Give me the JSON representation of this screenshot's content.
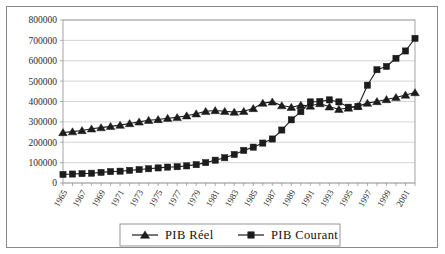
{
  "chart_data": {
    "type": "line",
    "title": "",
    "xlabel": "",
    "ylabel": "",
    "ylim": [
      0,
      800000
    ],
    "ytick_step": 100000,
    "yticks": [
      "0",
      "100000",
      "200000",
      "300000",
      "400000",
      "500000",
      "600000",
      "700000",
      "800000"
    ],
    "grid": true,
    "legend_position": "bottom",
    "x": [
      1965,
      1966,
      1967,
      1968,
      1969,
      1970,
      1971,
      1972,
      1973,
      1974,
      1975,
      1976,
      1977,
      1978,
      1979,
      1980,
      1981,
      1982,
      1983,
      1984,
      1985,
      1986,
      1987,
      1988,
      1989,
      1990,
      1991,
      1992,
      1993,
      1994,
      1995,
      1996,
      1997,
      1998,
      1999,
      2000,
      2001,
      2002
    ],
    "xtick_labels": [
      "1965",
      "1967",
      "1969",
      "1971",
      "1973",
      "1975",
      "1977",
      "1979",
      "1981",
      "1983",
      "1985",
      "1987",
      "1989",
      "1991",
      "1993",
      "1995",
      "1997",
      "1999",
      "2001"
    ],
    "series": [
      {
        "name": "PIB Réel",
        "marker": "triangle",
        "color": "#1c1c1c",
        "values": [
          248000,
          252000,
          258000,
          266000,
          272000,
          278000,
          284000,
          292000,
          300000,
          308000,
          312000,
          318000,
          322000,
          330000,
          340000,
          352000,
          356000,
          352000,
          348000,
          352000,
          366000,
          392000,
          398000,
          380000,
          372000,
          382000,
          378000,
          390000,
          374000,
          362000,
          368000,
          376000,
          392000,
          400000,
          410000,
          420000,
          432000,
          444000
        ]
      },
      {
        "name": "PIB Courant",
        "marker": "square",
        "color": "#1c1c1c",
        "values": [
          42000,
          44000,
          46000,
          48000,
          52000,
          56000,
          58000,
          62000,
          66000,
          70000,
          74000,
          78000,
          80000,
          84000,
          90000,
          100000,
          112000,
          124000,
          140000,
          160000,
          176000,
          196000,
          216000,
          260000,
          310000,
          350000,
          398000,
          400000,
          408000,
          398000,
          372000,
          376000,
          480000,
          556000,
          572000,
          612000,
          648000,
          710000
        ]
      }
    ]
  },
  "legend": {
    "items": [
      {
        "label": "PIB  Réel",
        "marker": "triangle"
      },
      {
        "label": "PIB  Courant",
        "marker": "square"
      }
    ]
  }
}
